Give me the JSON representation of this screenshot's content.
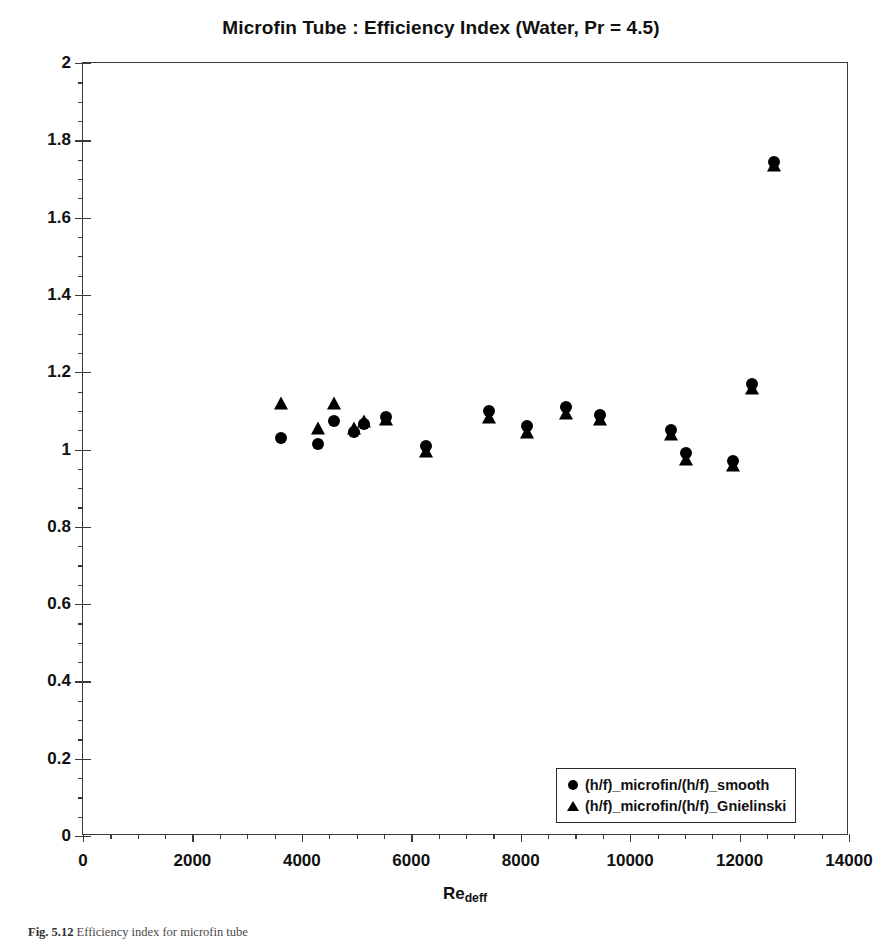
{
  "chart_data": {
    "type": "scatter",
    "title": "Microfin Tube : Efficiency Index (Water, Pr = 4.5)",
    "xlabel": "Re_deff",
    "ylabel": "(h_deff/f_deff)_microfin/(h/f)_smooth",
    "xlim": [
      0,
      14000
    ],
    "ylim": [
      0,
      2
    ],
    "xticks": [
      0,
      2000,
      4000,
      6000,
      8000,
      10000,
      12000,
      14000
    ],
    "yticks": [
      0,
      0.2,
      0.4,
      0.6,
      0.8,
      1,
      1.2,
      1.4,
      1.6,
      1.8,
      2
    ],
    "xtick_labels": [
      "0",
      "2000",
      "4000",
      "6000",
      "8000",
      "10000",
      "12000",
      "14000"
    ],
    "ytick_labels": [
      "0",
      "0.2",
      "0.4",
      "0.6",
      "0.8",
      "1",
      "1.2",
      "1.4",
      "1.6",
      "1.8",
      "2"
    ],
    "x_minor_interval": 500,
    "y_minor_interval": 0.05,
    "grid": false,
    "legend_position": "bottom-right",
    "series": [
      {
        "name": "(h/f)_microfin/(h/f)_smooth",
        "marker": "circle",
        "color": "#000000",
        "points": [
          {
            "x": 3620,
            "y": 1.03
          },
          {
            "x": 4300,
            "y": 1.015
          },
          {
            "x": 4590,
            "y": 1.075
          },
          {
            "x": 4960,
            "y": 1.045
          },
          {
            "x": 5140,
            "y": 1.065
          },
          {
            "x": 5530,
            "y": 1.085
          },
          {
            "x": 6270,
            "y": 1.01
          },
          {
            "x": 7420,
            "y": 1.1
          },
          {
            "x": 8120,
            "y": 1.06
          },
          {
            "x": 8820,
            "y": 1.11
          },
          {
            "x": 9440,
            "y": 1.09
          },
          {
            "x": 10740,
            "y": 1.05
          },
          {
            "x": 11020,
            "y": 0.99
          },
          {
            "x": 11880,
            "y": 0.97
          },
          {
            "x": 12230,
            "y": 1.17
          },
          {
            "x": 12630,
            "y": 1.745
          }
        ]
      },
      {
        "name": "(h/f)_microfin/(h/f)_Gnielinski",
        "marker": "triangle",
        "color": "#000000",
        "points": [
          {
            "x": 3620,
            "y": 1.12
          },
          {
            "x": 4300,
            "y": 1.055
          },
          {
            "x": 4590,
            "y": 1.12
          },
          {
            "x": 4960,
            "y": 1.055
          },
          {
            "x": 5140,
            "y": 1.075
          },
          {
            "x": 5530,
            "y": 1.08
          },
          {
            "x": 6270,
            "y": 0.995
          },
          {
            "x": 7420,
            "y": 1.085
          },
          {
            "x": 8120,
            "y": 1.045
          },
          {
            "x": 8820,
            "y": 1.095
          },
          {
            "x": 9440,
            "y": 1.08
          },
          {
            "x": 10740,
            "y": 1.04
          },
          {
            "x": 11020,
            "y": 0.975
          },
          {
            "x": 11880,
            "y": 0.96
          },
          {
            "x": 12230,
            "y": 1.16
          },
          {
            "x": 12630,
            "y": 1.735
          }
        ]
      }
    ]
  },
  "legend": {
    "items": [
      {
        "marker": "circle",
        "label": "(h/f)_microfin/(h/f)_smooth"
      },
      {
        "marker": "triangle",
        "label": "(h/f)_microfin/(h/f)_Gnielinski"
      }
    ]
  },
  "caption": {
    "number": "Fig. 5.12",
    "text": "Efficiency index for microfin tube"
  }
}
